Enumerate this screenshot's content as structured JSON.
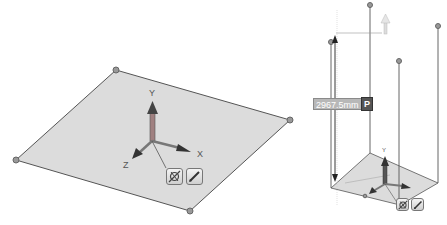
{
  "left_view": {
    "axis_labels": {
      "x": "X",
      "y": "Y",
      "z": "Z"
    },
    "buttons": [
      {
        "name": "snap-toggle",
        "icon": "snap-icon"
      },
      {
        "name": "edit-direction",
        "icon": "pen-icon"
      }
    ]
  },
  "right_view": {
    "axis_labels": {
      "y": "Y"
    },
    "dimension": {
      "value": "2967.5mm",
      "parameter_button": "P"
    },
    "buttons": [
      {
        "name": "snap-toggle",
        "icon": "snap-icon"
      },
      {
        "name": "edit-direction",
        "icon": "pen-icon"
      }
    ]
  },
  "colors": {
    "plane_fill": "#d9d9d9",
    "edge": "#555555",
    "vertex": "#8a8a8a",
    "dimension_box": "#b8b8b8",
    "p_box": "#555555"
  }
}
